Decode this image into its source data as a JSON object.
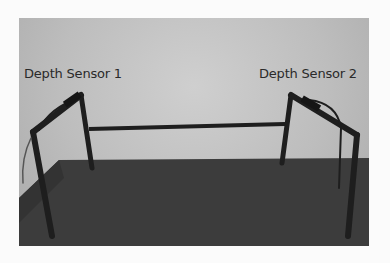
{
  "figure": {
    "labels": [
      {
        "text": "Depth Sensor 1"
      },
      {
        "text": "Depth Sensor 2"
      }
    ],
    "colors": {
      "wall": "#bdbdbd",
      "table": "#3b3b3b",
      "frame": "#1f1f1f",
      "background": "#fbfbfb"
    }
  }
}
